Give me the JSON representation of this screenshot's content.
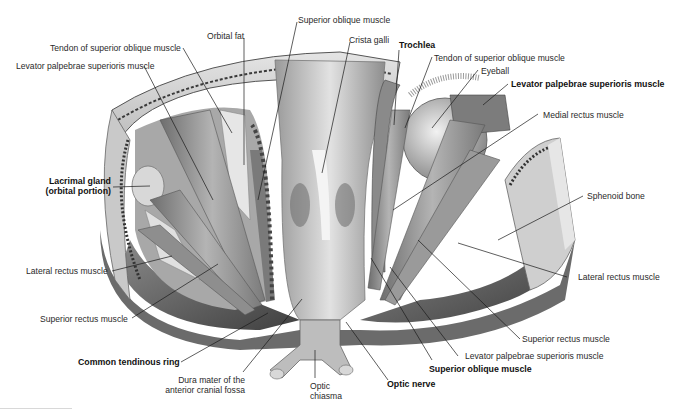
{
  "figure": {
    "labels": {
      "superior_oblique_top": "Superior oblique muscle",
      "orbital_fat": "Orbital fat",
      "crista_galli": "Crista galli",
      "tendon_so_left": "Tendon of superior oblique muscle",
      "levator_left": "Levator palpebrae superioris muscle",
      "trochlea": "Trochlea",
      "tendon_so_right": "Tendon of superior oblique muscle",
      "eyeball": "Eyeball",
      "levator_right_bold": "Levator palpebrae superioris muscle",
      "medial_rectus": "Medial rectus muscle",
      "lacrimal_gland_1": "Lacrimal gland",
      "lacrimal_gland_2": "(orbital portion)",
      "sphenoid_bone": "Sphenoid bone",
      "lateral_rectus_left": "Lateral rectus muscle",
      "lateral_rectus_right": "Lateral rectus muscle",
      "superior_rectus_left": "Superior rectus muscle",
      "superior_rectus_right": "Superior rectus muscle",
      "levator_bottom": "Levator palpebrae superioris muscle",
      "common_tendinous_ring": "Common tendinous ring",
      "dura_1": "Dura mater of the",
      "dura_2": "anterior cranial fossa",
      "optic_chiasma_1": "Optic",
      "optic_chiasma_2": "chiasma",
      "optic_nerve": "Optic nerve",
      "superior_oblique_bottom": "Superior oblique muscle"
    },
    "colors": {
      "text": "#2a2a2a",
      "leader": "#1a1a1a",
      "bone_light": "#d9d9d9",
      "muscle": "#9a9a9a",
      "shadow": "#5a5a5a"
    }
  }
}
